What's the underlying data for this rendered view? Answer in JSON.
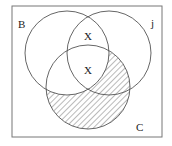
{
  "diagram": {
    "type": "venn",
    "universe_label": "",
    "sets": [
      {
        "name": "B",
        "label": "B"
      },
      {
        "name": "j",
        "label": "j"
      },
      {
        "name": "C",
        "label": "C"
      }
    ],
    "marks": [
      {
        "region": "B∩j only",
        "text": "X"
      },
      {
        "region": "B∩j∩C",
        "text": "X"
      }
    ],
    "shaded_region": "C \\ B",
    "colors": {
      "stroke": "#555555",
      "hatch": "#666666",
      "background": "#ffffff"
    }
  }
}
